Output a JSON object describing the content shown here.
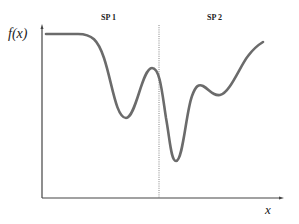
{
  "diagram": {
    "y_axis_label": "f(x)",
    "x_axis_label": "x",
    "regions": [
      {
        "label": "SP 1"
      },
      {
        "label": "SP 2"
      }
    ],
    "divider": {
      "style": "dotted"
    },
    "colors": {
      "curve": "#6b6b6b",
      "axis": "#444444",
      "divider": "#777777",
      "background": "#ffffff"
    },
    "curve_description": "Flat plateau, descends to local minimum in SP 1, local maximum near divider, global minimum just inside SP 2, small bump and shallow minimum, then rising to the right"
  }
}
